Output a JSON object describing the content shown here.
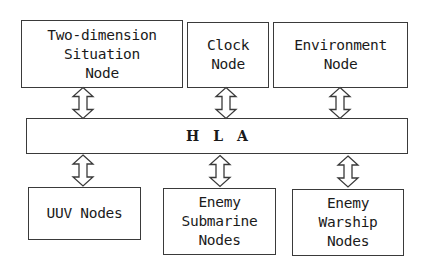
{
  "diagram": {
    "type": "block-architecture",
    "top_nodes": [
      {
        "id": "two-dimension-situation-node",
        "label": "Two-dimension\nSituation\nNode"
      },
      {
        "id": "clock-node",
        "label": "Clock\nNode"
      },
      {
        "id": "environment-node",
        "label": "Environment\nNode"
      }
    ],
    "bus": {
      "id": "hla-bus",
      "label": "HLA"
    },
    "bottom_nodes": [
      {
        "id": "uuv-nodes",
        "label": "UUV Nodes"
      },
      {
        "id": "enemy-submarine-nodes",
        "label": "Enemy\nSubmarine\nNodes"
      },
      {
        "id": "enemy-warship-nodes",
        "label": "Enemy\nWarship\nNodes"
      }
    ],
    "connections": [
      {
        "from": "two-dimension-situation-node",
        "to": "hla-bus",
        "type": "bidirectional"
      },
      {
        "from": "clock-node",
        "to": "hla-bus",
        "type": "bidirectional"
      },
      {
        "from": "environment-node",
        "to": "hla-bus",
        "type": "bidirectional"
      },
      {
        "from": "hla-bus",
        "to": "uuv-nodes",
        "type": "bidirectional"
      },
      {
        "from": "hla-bus",
        "to": "enemy-submarine-nodes",
        "type": "bidirectional"
      },
      {
        "from": "hla-bus",
        "to": "enemy-warship-nodes",
        "type": "bidirectional"
      }
    ],
    "colors": {
      "stroke": "#3a3a3a",
      "fill": "#ffffff",
      "text": "#1a1a1a"
    }
  }
}
